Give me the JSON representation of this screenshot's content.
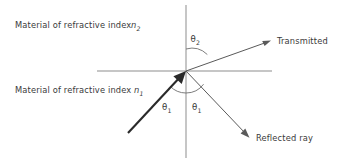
{
  "figure": {
    "background_color": "#ffffff",
    "line_color": "#8d8d8d",
    "ray_color": "#5a5a5a",
    "incident_color": "#2a2a2a",
    "text_color": "#3a3a3a"
  },
  "labels": {
    "medium_upper": "Material of refractive index",
    "medium_upper_symbol": "n",
    "medium_upper_subscript": "2",
    "medium_lower": "Material of refractive index",
    "medium_lower_symbol": "n",
    "medium_lower_subscript": "1",
    "transmitted": "Transmitted",
    "reflected": "Reflected ray"
  },
  "angles": {
    "theta_symbol": "θ",
    "transmission_subscript": "2",
    "incidence_subscript": "1",
    "reflection_subscript": "1"
  },
  "geometry": {
    "origin_x": 186,
    "origin_y": 71,
    "interface_x_start": 97,
    "interface_x_end": 272,
    "normal_y_top": 5,
    "normal_y_bottom": 158,
    "incident_tail_x": 128,
    "incident_tail_y": 133,
    "transmitted_tip_x": 271,
    "transmitted_tip_y": 41,
    "reflected_tip_x": 249,
    "reflected_tip_y": 137,
    "arc_radius": 22
  }
}
